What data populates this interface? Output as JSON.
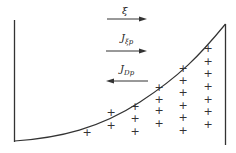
{
  "diagram": {
    "type": "band-diagram",
    "labels": {
      "field": "ξ",
      "drift_current_main": "J",
      "drift_current_sub": "ξp",
      "diffusion_current_main": "J",
      "diffusion_current_sub": "Dp"
    },
    "arrows": [
      {
        "name": "field-arrow",
        "direction": "right"
      },
      {
        "name": "drift-current-arrow",
        "direction": "right"
      },
      {
        "name": "diffusion-current-arrow",
        "direction": "left"
      }
    ],
    "charge_symbol": "+",
    "charge_columns": [
      {
        "x": 87,
        "ys": [
          132
        ]
      },
      {
        "x": 111,
        "ys": [
          112,
          125
        ]
      },
      {
        "x": 135,
        "ys": [
          106,
          118,
          131
        ]
      },
      {
        "x": 159,
        "ys": [
          87,
          99,
          110,
          123
        ]
      },
      {
        "x": 183,
        "ys": [
          68,
          80,
          92,
          105,
          117,
          130
        ]
      },
      {
        "x": 208,
        "ys": [
          48,
          61,
          73,
          86,
          99,
          111,
          124
        ]
      }
    ],
    "colors": {
      "line": "#333333",
      "background": "#ffffff"
    }
  }
}
